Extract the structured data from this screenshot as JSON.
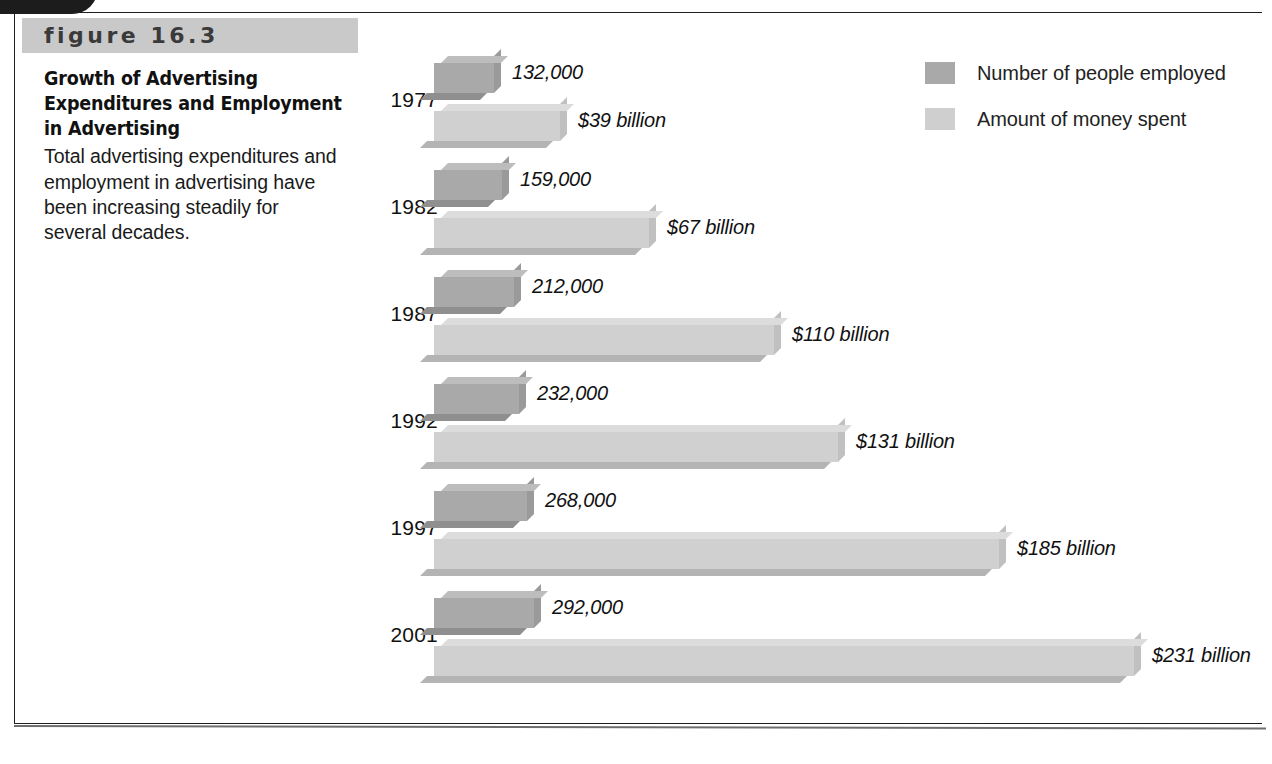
{
  "figure": {
    "label": "figure 16.3",
    "title": "Growth of Advertising Expenditures and Employment in Advertising",
    "caption": "Total advertising expenditures and employment in advertising have been increasing steadily for several decades."
  },
  "legend": {
    "items": [
      {
        "label": "Number of people employed",
        "color": "#a9a9a9"
      },
      {
        "label": "Amount of money spent",
        "color": "#cfcfcf"
      }
    ]
  },
  "colors": {
    "employment_fill": "#a9a9a9",
    "employment_top": "#bdbdbd",
    "employment_bottom": "#8f8f8f",
    "employment_side": "#9a9a9a",
    "spending_fill": "#d0d0d0",
    "spending_top": "#dcdcdc",
    "spending_bottom": "#b4b4b4",
    "spending_side": "#c0c0c0",
    "band": "#c9c9c9",
    "frame": "#1e1e1e"
  },
  "chart_data": {
    "type": "bar",
    "orientation": "horizontal",
    "title": "Growth of Advertising Expenditures and Employment in Advertising",
    "xlabel": "",
    "ylabel": "",
    "categories": [
      "1977",
      "1982",
      "1987",
      "1992",
      "1997",
      "2001"
    ],
    "grid": false,
    "legend_position": "top-right",
    "series": [
      {
        "name": "Number of people employed",
        "unit": "people",
        "values": [
          132000,
          159000,
          212000,
          232000,
          268000,
          292000
        ],
        "labels": [
          "132,000",
          "159,000",
          "212,000",
          "232,000",
          "268,000",
          "292,000"
        ]
      },
      {
        "name": "Amount of money spent",
        "unit": "billion USD",
        "values": [
          39,
          67,
          110,
          131,
          185,
          231
        ],
        "labels": [
          "$39 billion",
          "$67 billion",
          "$110 billion",
          "$131 billion",
          "$185 billion",
          "$231 billion"
        ]
      }
    ]
  },
  "rows": [
    {
      "year": "1977",
      "employed_label": "132,000",
      "employed_bar_px": 60,
      "spent_label": "$39 billion",
      "spent_bar_px": 126
    },
    {
      "year": "1982",
      "employed_label": "159,000",
      "employed_bar_px": 68,
      "spent_label": "$67 billion",
      "spent_bar_px": 215
    },
    {
      "year": "1987",
      "employed_label": "212,000",
      "employed_bar_px": 80,
      "spent_label": "$110 billion",
      "spent_bar_px": 340
    },
    {
      "year": "1992",
      "employed_label": "232,000",
      "employed_bar_px": 85,
      "spent_label": "$131 billion",
      "spent_bar_px": 404
    },
    {
      "year": "1997",
      "employed_label": "268,000",
      "employed_bar_px": 93,
      "spent_label": "$185 billion",
      "spent_bar_px": 565
    },
    {
      "year": "2001",
      "employed_label": "292,000",
      "employed_bar_px": 100,
      "spent_label": "$231 billion",
      "spent_bar_px": 700
    }
  ]
}
